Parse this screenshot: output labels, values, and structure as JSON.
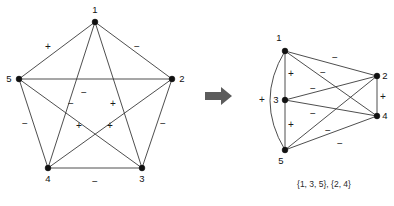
{
  "figure": {
    "arrow_icon": "right-arrow-icon",
    "colors": {
      "edge": "#3a3a3a",
      "node": "#111111",
      "text": "#111111",
      "arrow": "#5c5c5c",
      "background": "#ffffff"
    }
  },
  "left_graph": {
    "name": "pentagon-signed-graph",
    "nodes": [
      {
        "id": "1",
        "label": "1",
        "x": 95,
        "y": 22,
        "label_x": 95,
        "label_y": 13
      },
      {
        "id": "2",
        "label": "2",
        "x": 172,
        "y": 79,
        "label_x": 182,
        "label_y": 82
      },
      {
        "id": "3",
        "label": "3",
        "x": 142,
        "y": 168,
        "label_x": 142,
        "label_y": 182
      },
      {
        "id": "4",
        "label": "4",
        "x": 48,
        "y": 168,
        "label_x": 48,
        "label_y": 182
      },
      {
        "id": "5",
        "label": "5",
        "x": 19,
        "y": 79,
        "label_x": 9,
        "label_y": 82
      }
    ],
    "edges": [
      {
        "from": "1",
        "to": "5",
        "sign": "+"
      },
      {
        "from": "1",
        "to": "2",
        "sign": "−"
      },
      {
        "from": "1",
        "to": "4",
        "sign": "−"
      },
      {
        "from": "1",
        "to": "3",
        "sign": "+"
      },
      {
        "from": "5",
        "to": "2",
        "sign": "−"
      },
      {
        "from": "5",
        "to": "4",
        "sign": "−"
      },
      {
        "from": "5",
        "to": "3",
        "sign": "+"
      },
      {
        "from": "2",
        "to": "4",
        "sign": "+"
      },
      {
        "from": "2",
        "to": "3",
        "sign": "−"
      },
      {
        "from": "4",
        "to": "3",
        "sign": "−"
      }
    ],
    "sign_labels": [
      {
        "text": "+",
        "x": 48,
        "y": 50,
        "for": "1-5"
      },
      {
        "text": "−",
        "x": 137,
        "y": 50,
        "for": "1-2"
      },
      {
        "text": "−",
        "x": 84,
        "y": 96,
        "for": "5-2"
      },
      {
        "text": "−",
        "x": 71,
        "y": 107,
        "for": "1-4"
      },
      {
        "text": "+",
        "x": 113,
        "y": 107,
        "for": "1-3"
      },
      {
        "text": "+",
        "x": 79,
        "y": 129,
        "for": "5-3"
      },
      {
        "text": "+",
        "x": 110,
        "y": 129,
        "for": "2-4"
      },
      {
        "text": "−",
        "x": 25,
        "y": 127,
        "for": "5-4"
      },
      {
        "text": "−",
        "x": 163,
        "y": 127,
        "for": "2-3"
      },
      {
        "text": "−",
        "x": 95,
        "y": 185,
        "for": "4-3"
      }
    ]
  },
  "right_graph": {
    "name": "balanced-signed-graph",
    "nodes": [
      {
        "id": "1",
        "label": "1",
        "x": 285,
        "y": 51,
        "label_x": 279,
        "label_y": 41
      },
      {
        "id": "3",
        "label": "3",
        "x": 285,
        "y": 100,
        "label_x": 276,
        "label_y": 103
      },
      {
        "id": "5",
        "label": "5",
        "x": 285,
        "y": 150,
        "label_x": 281,
        "label_y": 164
      },
      {
        "id": "2",
        "label": "2",
        "x": 377,
        "y": 76,
        "label_x": 385,
        "label_y": 79
      },
      {
        "id": "4",
        "label": "4",
        "x": 377,
        "y": 116,
        "label_x": 385,
        "label_y": 119
      }
    ],
    "edges": [
      {
        "from": "1",
        "to": "3",
        "sign": "+",
        "kind": "straight"
      },
      {
        "from": "3",
        "to": "5",
        "sign": "+",
        "kind": "straight"
      },
      {
        "from": "1",
        "to": "5",
        "sign": "+",
        "kind": "curve"
      },
      {
        "from": "2",
        "to": "4",
        "sign": "+",
        "kind": "straight"
      },
      {
        "from": "1",
        "to": "2",
        "sign": "−",
        "kind": "straight"
      },
      {
        "from": "1",
        "to": "4",
        "sign": "−",
        "kind": "straight"
      },
      {
        "from": "3",
        "to": "2",
        "sign": "−",
        "kind": "straight"
      },
      {
        "from": "3",
        "to": "4",
        "sign": "−",
        "kind": "straight"
      },
      {
        "from": "5",
        "to": "2",
        "sign": "−",
        "kind": "straight"
      },
      {
        "from": "5",
        "to": "4",
        "sign": "−",
        "kind": "straight"
      }
    ],
    "sign_labels": [
      {
        "text": "+",
        "x": 291,
        "y": 77,
        "for": "1-3"
      },
      {
        "text": "+",
        "x": 291,
        "y": 128,
        "for": "3-5"
      },
      {
        "text": "+",
        "x": 262,
        "y": 103,
        "for": "1-5"
      },
      {
        "text": "+",
        "x": 383,
        "y": 100,
        "for": "2-4"
      },
      {
        "text": "−",
        "x": 335,
        "y": 61,
        "for": "1-2"
      },
      {
        "text": "−",
        "x": 323,
        "y": 76,
        "for": "1-4"
      },
      {
        "text": "−",
        "x": 313,
        "y": 92,
        "for": "3-2"
      },
      {
        "text": "−",
        "x": 313,
        "y": 117,
        "for": "3-4"
      },
      {
        "text": "−",
        "x": 328,
        "y": 134,
        "for": "5-4"
      },
      {
        "text": "−",
        "x": 340,
        "y": 147,
        "for": "5-2"
      }
    ],
    "caption": "{1, 3, 5}, {2, 4}"
  }
}
